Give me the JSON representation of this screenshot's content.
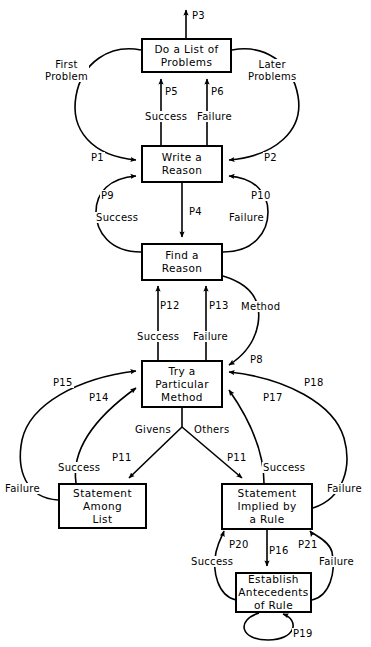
{
  "figure": {
    "background_color": "#ffffff",
    "line_color": "#000000",
    "width": 371,
    "height": 647
  },
  "nodes": [
    {
      "id": "do-a-list-of-problems",
      "lines": [
        "Do a List of",
        "Problems"
      ],
      "x": 141,
      "y": 38,
      "w": 91,
      "h": 35
    },
    {
      "id": "write-a-reason",
      "lines": [
        "Write a",
        "Reason"
      ],
      "x": 141,
      "y": 145,
      "w": 82,
      "h": 38
    },
    {
      "id": "find-a-reason",
      "lines": [
        "Find a",
        "Reason"
      ],
      "x": 141,
      "y": 243,
      "w": 82,
      "h": 38
    },
    {
      "id": "try-a-particular-method",
      "lines": [
        "Try a",
        "Particular",
        "Method"
      ],
      "x": 141,
      "y": 360,
      "w": 82,
      "h": 48
    },
    {
      "id": "statement-among-list",
      "lines": [
        "Statement",
        "Among",
        "List"
      ],
      "x": 58,
      "y": 483,
      "w": 89,
      "h": 46
    },
    {
      "id": "statement-implied-by-a-rule",
      "lines": [
        "Statement",
        "Implied by",
        "a Rule"
      ],
      "x": 221,
      "y": 483,
      "w": 92,
      "h": 47
    },
    {
      "id": "establish-antecedents-of-rule",
      "lines": [
        "Establish",
        "Antecedents",
        "of Rule"
      ],
      "x": 235,
      "y": 572,
      "w": 77,
      "h": 41
    }
  ],
  "labels": [
    {
      "id": "p3",
      "text": "P3",
      "x": 191,
      "y": 10
    },
    {
      "id": "first-problem",
      "lines": [
        "First",
        "Problem"
      ],
      "x": 44,
      "y": 59
    },
    {
      "id": "later-problems",
      "lines": [
        "Later",
        "Problems"
      ],
      "x": 247,
      "y": 59
    },
    {
      "id": "p5",
      "text": "P5",
      "x": 164,
      "y": 86
    },
    {
      "id": "p6",
      "text": "P6",
      "x": 210,
      "y": 86
    },
    {
      "id": "success-p5",
      "text": "Success",
      "x": 144,
      "y": 111
    },
    {
      "id": "failure-p6",
      "text": "Failure",
      "x": 196,
      "y": 111
    },
    {
      "id": "p1",
      "text": "P1",
      "x": 90,
      "y": 152
    },
    {
      "id": "p2",
      "text": "P2",
      "x": 263,
      "y": 152
    },
    {
      "id": "p9",
      "text": "P9",
      "x": 100,
      "y": 190
    },
    {
      "id": "p10",
      "text": "P10",
      "x": 250,
      "y": 190
    },
    {
      "id": "p4",
      "text": "P4",
      "x": 188,
      "y": 206
    },
    {
      "id": "success-p9",
      "text": "Success",
      "x": 95,
      "y": 212
    },
    {
      "id": "failure-p10",
      "text": "Failure",
      "x": 228,
      "y": 212
    },
    {
      "id": "p12",
      "text": "P12",
      "x": 159,
      "y": 300
    },
    {
      "id": "p13",
      "text": "P13",
      "x": 208,
      "y": 300
    },
    {
      "id": "method",
      "text": "Method",
      "x": 240,
      "y": 301
    },
    {
      "id": "success-p12",
      "text": "Success",
      "x": 136,
      "y": 331
    },
    {
      "id": "failure-p13",
      "text": "Failure",
      "x": 192,
      "y": 331
    },
    {
      "id": "p8",
      "text": "P8",
      "x": 249,
      "y": 354
    },
    {
      "id": "p15",
      "text": "P15",
      "x": 52,
      "y": 377
    },
    {
      "id": "p18",
      "text": "P18",
      "x": 303,
      "y": 377
    },
    {
      "id": "p14",
      "text": "P14",
      "x": 88,
      "y": 392
    },
    {
      "id": "p17",
      "text": "P17",
      "x": 262,
      "y": 392
    },
    {
      "id": "givens",
      "text": "Givens",
      "x": 134,
      "y": 424
    },
    {
      "id": "others",
      "text": "Others",
      "x": 193,
      "y": 424
    },
    {
      "id": "p11-left",
      "text": "P11",
      "x": 111,
      "y": 452
    },
    {
      "id": "p11-right",
      "text": "P11",
      "x": 226,
      "y": 452
    },
    {
      "id": "success-p14",
      "text": "Success",
      "x": 57,
      "y": 462
    },
    {
      "id": "success-p17",
      "text": "Success",
      "x": 262,
      "y": 462
    },
    {
      "id": "failure-p15",
      "text": "Failure",
      "x": 4,
      "y": 483
    },
    {
      "id": "failure-p18",
      "text": "Failure",
      "x": 326,
      "y": 483
    },
    {
      "id": "p20",
      "text": "P20",
      "x": 228,
      "y": 539
    },
    {
      "id": "p16",
      "text": "P16",
      "x": 268,
      "y": 545
    },
    {
      "id": "p21",
      "text": "P21",
      "x": 297,
      "y": 539
    },
    {
      "id": "success-p20",
      "text": "Success",
      "x": 190,
      "y": 556
    },
    {
      "id": "failure-p21",
      "text": "Failure",
      "x": 318,
      "y": 556
    },
    {
      "id": "p19",
      "text": "P19",
      "x": 292,
      "y": 628
    }
  ],
  "edges": [
    {
      "id": "p3-out",
      "from": "do-a-list-of-problems",
      "to": "exit",
      "label": "P3",
      "kind": "straight-up"
    },
    {
      "id": "first-problem",
      "from": "do-a-list-of-problems",
      "to": "write-a-reason",
      "label": "First Problem / P1",
      "kind": "curve-left"
    },
    {
      "id": "later-problems",
      "from": "do-a-list-of-problems",
      "to": "write-a-reason",
      "label": "Later Problems / P2",
      "kind": "curve-right"
    },
    {
      "id": "p5-success",
      "from": "write-a-reason",
      "to": "do-a-list-of-problems",
      "label": "P5 Success",
      "kind": "straight-up"
    },
    {
      "id": "p6-failure",
      "from": "write-a-reason",
      "to": "do-a-list-of-problems",
      "label": "P6 Failure",
      "kind": "straight-up"
    },
    {
      "id": "p4",
      "from": "write-a-reason",
      "to": "find-a-reason",
      "label": "P4",
      "kind": "straight-down"
    },
    {
      "id": "p9-success",
      "from": "find-a-reason",
      "to": "write-a-reason",
      "label": "P9 Success",
      "kind": "curve-left"
    },
    {
      "id": "p10-failure",
      "from": "find-a-reason",
      "to": "write-a-reason",
      "label": "P10 Failure",
      "kind": "curve-right"
    },
    {
      "id": "p12-success",
      "from": "try-a-particular-method",
      "to": "find-a-reason",
      "label": "P12 Success",
      "kind": "straight-up"
    },
    {
      "id": "p13-failure",
      "from": "try-a-particular-method",
      "to": "find-a-reason",
      "label": "P13 Failure",
      "kind": "straight-up"
    },
    {
      "id": "p8-method",
      "from": "find-a-reason",
      "to": "try-a-particular-method",
      "label": "Method P8",
      "kind": "curve-right"
    },
    {
      "id": "p15-failure",
      "from": "statement-among-list",
      "to": "try-a-particular-method",
      "label": "P15 Failure",
      "kind": "curve-left"
    },
    {
      "id": "p14-success",
      "from": "statement-among-list",
      "to": "try-a-particular-method",
      "label": "P14 Success",
      "kind": "curve-left"
    },
    {
      "id": "p11-givens",
      "from": "try-a-particular-method",
      "to": "statement-among-list",
      "label": "Givens P11",
      "kind": "diagonal-left"
    },
    {
      "id": "p11-others",
      "from": "try-a-particular-method",
      "to": "statement-implied-by-a-rule",
      "label": "Others P11",
      "kind": "diagonal-right"
    },
    {
      "id": "p17-success",
      "from": "statement-implied-by-a-rule",
      "to": "try-a-particular-method",
      "label": "P17 Success",
      "kind": "curve-right"
    },
    {
      "id": "p18-failure",
      "from": "statement-implied-by-a-rule",
      "to": "try-a-particular-method",
      "label": "P18 Failure",
      "kind": "curve-right"
    },
    {
      "id": "p16",
      "from": "statement-implied-by-a-rule",
      "to": "establish-antecedents-of-rule",
      "label": "P16",
      "kind": "straight-down"
    },
    {
      "id": "p20-success",
      "from": "establish-antecedents-of-rule",
      "to": "statement-implied-by-a-rule",
      "label": "P20 Success",
      "kind": "curve-left"
    },
    {
      "id": "p21-failure",
      "from": "establish-antecedents-of-rule",
      "to": "statement-implied-by-a-rule",
      "label": "P21 Failure",
      "kind": "curve-right"
    },
    {
      "id": "p19-self",
      "from": "establish-antecedents-of-rule",
      "to": "establish-antecedents-of-rule",
      "label": "P19",
      "kind": "self-loop"
    }
  ]
}
